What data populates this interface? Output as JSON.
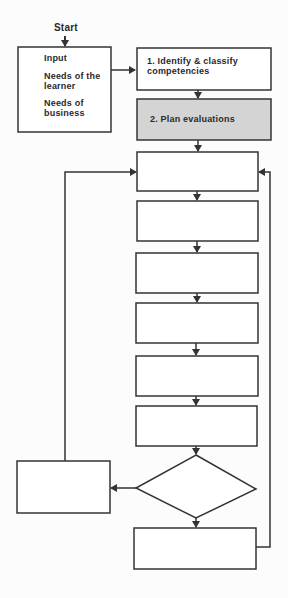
{
  "diagram": {
    "type": "flowchart",
    "start": {
      "label": "Start"
    },
    "input_box": {
      "heading": "Input",
      "items": [
        "Needs of the learner",
        "Needs of business"
      ]
    },
    "steps": [
      {
        "id": 1,
        "label": "1.  Identify & classify competencies",
        "highlighted": false
      },
      {
        "id": 2,
        "label": "2.  Plan evaluations",
        "highlighted": true
      },
      {
        "id": 3,
        "label": "",
        "highlighted": false
      },
      {
        "id": 4,
        "label": "",
        "highlighted": false
      },
      {
        "id": 5,
        "label": "",
        "highlighted": false
      },
      {
        "id": 6,
        "label": "",
        "highlighted": false
      },
      {
        "id": 7,
        "label": "",
        "highlighted": false
      },
      {
        "id": 8,
        "label": "",
        "highlighted": false
      }
    ],
    "decision": {
      "label": ""
    },
    "left_branch_box": {
      "label": ""
    },
    "bottom_box": {
      "label": ""
    },
    "colors": {
      "line": "#333333",
      "highlight_fill": "#d4d4d4",
      "box_fill": "#ffffff",
      "background": "#fcfcfc"
    }
  }
}
